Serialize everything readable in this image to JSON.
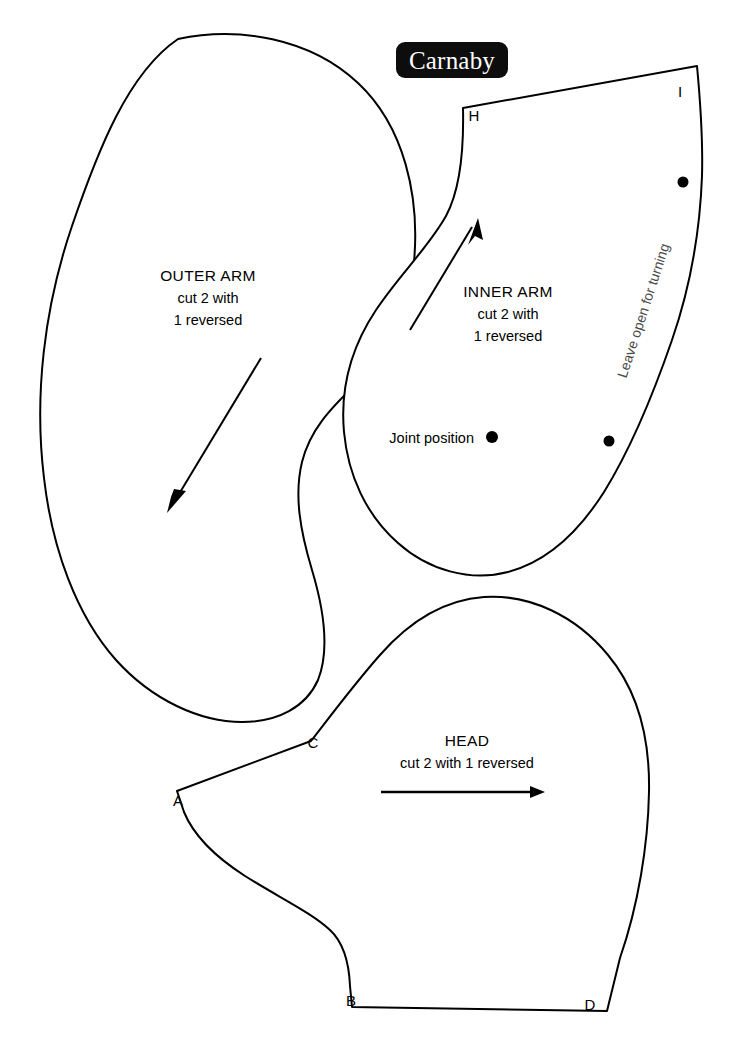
{
  "document": {
    "brand": "Carnaby",
    "type": "sewing-pattern-sheet",
    "background_color": "#ffffff",
    "ink_color": "#000000"
  },
  "pieces": {
    "outer_arm": {
      "title": "OUTER ARM",
      "line2": "cut 2 with",
      "line3": "1 reversed",
      "grainline_direction": "down-left"
    },
    "inner_arm": {
      "title": "INNER ARM",
      "line2": "cut 2 with",
      "line3": "1 reversed",
      "grainline_direction": "up-right",
      "joint_label": "Joint position",
      "turning_note": "Leave open for turning",
      "turning_note_color": "#4a4a4a",
      "corner_labels": {
        "h": "H",
        "i": "I"
      }
    },
    "head": {
      "title": "HEAD",
      "line2": "cut 2 with 1 reversed",
      "grainline_direction": "right",
      "corner_labels": {
        "a": "A",
        "b": "B",
        "c": "C",
        "d": "D"
      }
    }
  }
}
